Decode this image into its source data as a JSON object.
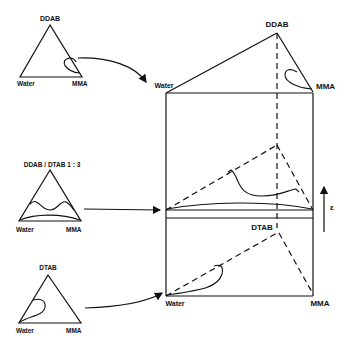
{
  "figure": {
    "type": "ternary phase prism",
    "axis_label": "ε",
    "left_panels": [
      {
        "id": "top",
        "title": "DDAB",
        "left_corner": "Water",
        "right_corner": "MMA"
      },
      {
        "id": "middle",
        "title": "DDAB / DTAB  1 : 3",
        "left_corner": "Water",
        "right_corner": "MMA"
      },
      {
        "id": "bottom",
        "title": "DTAB",
        "left_corner": "Water",
        "right_corner": "MMA"
      }
    ],
    "prism": {
      "top_apex": "DDAB",
      "top_left": "Water",
      "top_right": "MMA",
      "bottom_apex": "DTAB",
      "bottom_left": "Water",
      "bottom_right": "MMA"
    }
  },
  "colors": {
    "ink": "#111111",
    "background": "#ffffff"
  }
}
